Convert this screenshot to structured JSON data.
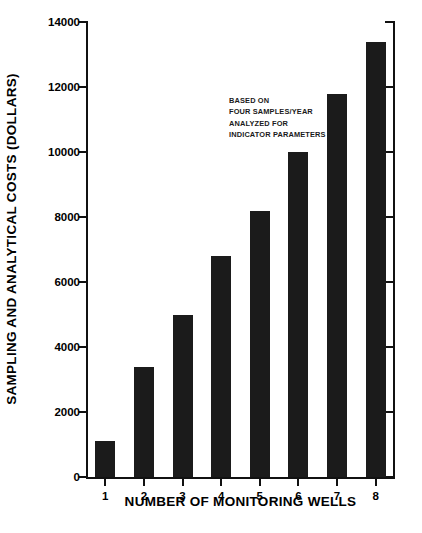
{
  "chart_data": {
    "type": "bar",
    "title": "",
    "subtitle": "",
    "xlabel": "NUMBER OF MONITORING WELLS",
    "ylabel": "SAMPLING AND ANALYTICAL COSTS (DOLLARS)",
    "categories": [
      "1",
      "2",
      "3",
      "4",
      "5",
      "6",
      "7",
      "8"
    ],
    "values": [
      1100,
      3400,
      5000,
      6800,
      8200,
      10000,
      11800,
      13400
    ],
    "ylim": [
      0,
      14000
    ],
    "ytick_labels": [
      "0",
      "2000",
      "4000",
      "6000",
      "8000",
      "10000",
      "12000",
      "14000"
    ],
    "ytick_values": [
      0,
      2000,
      4000,
      6000,
      8000,
      10000,
      12000,
      14000
    ],
    "ytick_step": 2000,
    "grid": false,
    "legend": null,
    "bar_color": "#1b1b1b",
    "axis_color": "#111111",
    "background_color": "#ffffff",
    "annotations": [
      {
        "name": "basis-note",
        "lines": [
          "BASED ON",
          "FOUR SAMPLES/YEAR",
          "ANALYZED FOR",
          "INDICATOR PARAMETERS"
        ],
        "text": "BASED ON\nFOUR SAMPLES/YEAR\nANALYZED FOR\nINDICATOR PARAMETERS"
      }
    ]
  }
}
